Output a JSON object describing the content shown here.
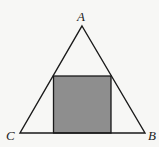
{
  "diagram": {
    "type": "geometry",
    "labels": {
      "a": "A",
      "b": "B",
      "c": "C"
    },
    "colors": {
      "stroke": "#1a1a1a",
      "square_fill": "#8e8e8e",
      "background": "#f7f7f5"
    },
    "triangle": {
      "A": [
        82,
        26
      ],
      "B": [
        145,
        133
      ],
      "C": [
        20,
        133
      ]
    },
    "square": {
      "x": 53,
      "y": 76,
      "width": 58,
      "height": 57
    }
  }
}
